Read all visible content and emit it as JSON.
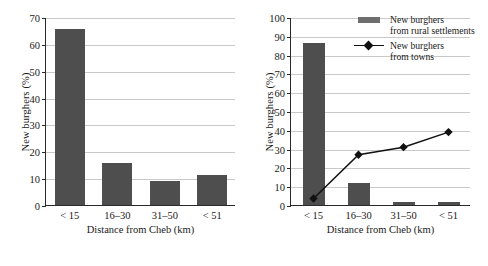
{
  "chart_data": [
    {
      "id": "left",
      "type": "bar",
      "title": "",
      "xlabel": "Distance from Cheb (km)",
      "ylabel": "New burghers (%)",
      "categories": [
        "< 15",
        "16–30",
        "31–50",
        "< 51"
      ],
      "values": [
        65.5,
        15.6,
        8.8,
        11.0
      ],
      "ylim": [
        0,
        70
      ],
      "yticks": [
        0,
        10,
        20,
        30,
        40,
        50,
        60,
        70
      ],
      "grid": true,
      "legend": null,
      "bar_color": "#4e4e4e"
    },
    {
      "id": "right",
      "type": "bar+line",
      "title": "",
      "xlabel": "Distance from Cheb (km)",
      "ylabel": "New burghers (%)",
      "categories": [
        "< 15",
        "16–30",
        "31–50",
        "< 51"
      ],
      "ylim": [
        0,
        100
      ],
      "yticks": [
        0,
        10,
        20,
        30,
        40,
        50,
        60,
        70,
        80,
        90,
        100
      ],
      "grid": true,
      "legend_position": "top-right",
      "bar_color": "#4e4e4e",
      "line_color": "#111111",
      "series": [
        {
          "name": "New burghers from rural settlements",
          "name_line1": "New burghers",
          "name_line2": "from rural settlements",
          "type": "bar",
          "values": [
            86.0,
            11.5,
            1.5,
            1.5
          ]
        },
        {
          "name": "New burghers from towns",
          "name_line1": "New burghers",
          "name_line2": "from towns",
          "type": "line",
          "marker": "diamond",
          "values": [
            4.0,
            27.3,
            31.3,
            39.3
          ]
        }
      ]
    }
  ]
}
